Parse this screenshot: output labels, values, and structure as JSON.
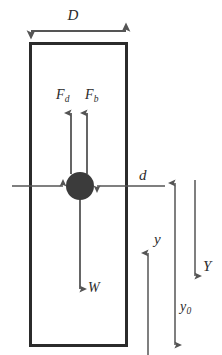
{
  "figure": {
    "background_color": "#ffffff",
    "width": 222,
    "height": 355
  },
  "colors": {
    "line": "#555555",
    "box_stroke": "#2b2b2b",
    "particle_fill": "#3b3b3b",
    "text": "#2b2b2b"
  },
  "labels": {
    "column_width": "D",
    "drag_force": "F",
    "drag_force_sub": "d",
    "buoyant_force": "F",
    "buoyant_force_sub": "b",
    "particle_diameter": "d",
    "weight": "W",
    "position": "y",
    "initial_position": "y",
    "initial_position_sub": "0",
    "total_depth": "Y"
  },
  "elements": {
    "column_box": {
      "x": 29,
      "y": 42,
      "width": 99,
      "height": 305,
      "stroke_width": 3
    },
    "particle": {
      "cx": 80,
      "cy": 186,
      "r": 14
    },
    "dimension_D": {
      "x1": 29,
      "x2": 128,
      "y": 31,
      "type": "double-headed-horizontal"
    },
    "arrow_Fd": {
      "x": 71,
      "y_tail": 172,
      "y_head": 112,
      "direction": "up"
    },
    "arrow_Fb": {
      "x": 87,
      "y_tail": 172,
      "y_head": 112,
      "direction": "up"
    },
    "arrow_W": {
      "x": 80,
      "y_tail": 200,
      "y_head": 290,
      "direction": "down"
    },
    "arrow_d": {
      "x_left": 12,
      "x_right": 165,
      "y": 186,
      "type": "inward-pointing-pair"
    },
    "arrow_y": {
      "x": 148,
      "y_tail": 355,
      "y_head": 252,
      "direction": "up"
    },
    "arrow_y0": {
      "x": 175,
      "y_top": 181,
      "y_bottom": 347,
      "type": "double-headed-vertical"
    },
    "arrow_Y": {
      "x": 195,
      "y_tail": 180,
      "y_head": 277,
      "direction": "down"
    }
  }
}
